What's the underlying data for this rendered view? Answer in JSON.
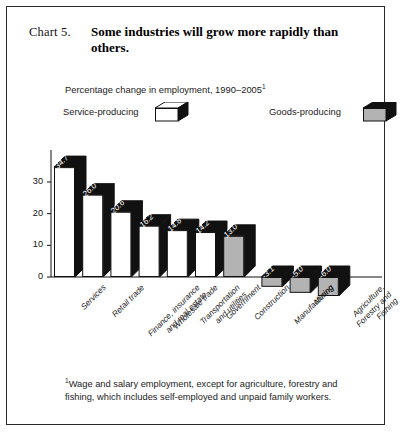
{
  "header": {
    "chart_label": "Chart 5.",
    "title": "Some industries will grow more rapidly than others."
  },
  "subtitle": {
    "text": "Percentage change in employment, 1990–2005",
    "footnote_marker": "1"
  },
  "legend": {
    "service_label": "Service-producing",
    "goods_label": "Goods-producing",
    "service_icon": "white-3d-bar-icon",
    "goods_icon": "gray-3d-bar-icon",
    "service_color": "#ffffff",
    "goods_color": "#b3b3b3",
    "shade_color": "#111111"
  },
  "footnote": {
    "marker": "1",
    "text": "Wage and salary employment, except for agriculture, forestry and fishing, which includes self-employed and unpaid family workers."
  },
  "chart_data": {
    "type": "bar",
    "title": "Some industries will grow more rapidly than others.",
    "subtitle": "Percentage change in employment, 1990–2005",
    "xlabel": "",
    "ylabel": "",
    "ylim": [
      -10,
      36
    ],
    "yticks": [
      0,
      10,
      20,
      30
    ],
    "ytick_labels": [
      "0",
      "10",
      "20",
      "30"
    ],
    "grid": false,
    "legend_position": "top",
    "legend_entries": [
      "Service-producing",
      "Goods-producing"
    ],
    "categories": [
      "Services",
      "Retail trade",
      "Finance, insurance\nand real estate",
      "Wholesale trade",
      "Transportation\nand utilities",
      "Government",
      "Construction",
      "Manufacturing",
      "Mining",
      "Agriculture,\nForestry and\nFishing"
    ],
    "values": [
      34.7,
      26.0,
      20.6,
      16.2,
      14.8,
      14.2,
      13.0,
      -3.1,
      -5.0,
      -6.0
    ],
    "value_labels": [
      "34.7",
      "26.0",
      "20.6",
      "16.2",
      "14.8",
      "14.2",
      "13.0",
      "-3.1",
      "-5.0",
      "-6.0"
    ],
    "groups": [
      "service",
      "service",
      "service",
      "service",
      "service",
      "service",
      "goods",
      "goods",
      "goods",
      "goods"
    ]
  }
}
